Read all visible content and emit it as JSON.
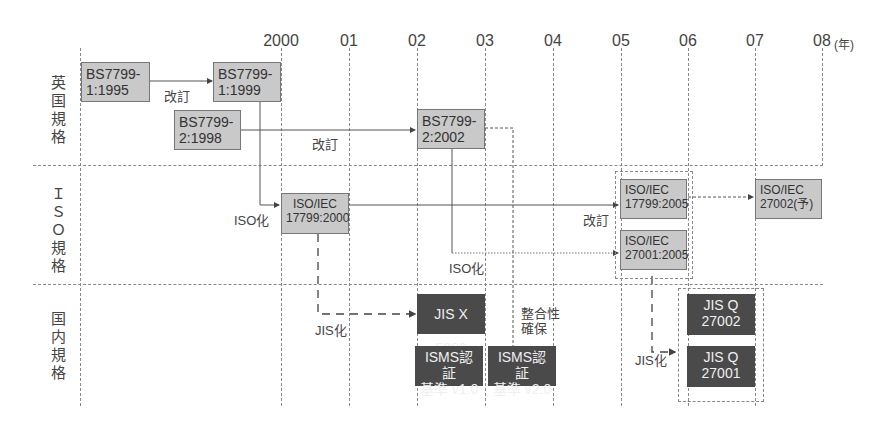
{
  "axis": {
    "years": [
      "2000",
      "01",
      "02",
      "03",
      "04",
      "05",
      "06",
      "07",
      "08"
    ],
    "unit": "(年)"
  },
  "rows": [
    {
      "label": "英国規格"
    },
    {
      "label": "ＩＳＯ規格"
    },
    {
      "label": "国内規格"
    }
  ],
  "boxes": {
    "bs7799_1_1995": {
      "line1": "BS7799-",
      "line2": "1:1995"
    },
    "bs7799_1_1999": {
      "line1": "BS7799-",
      "line2": "1:1999"
    },
    "bs7799_2_1998": {
      "line1": "BS7799-",
      "line2": "2:1998"
    },
    "bs7799_2_2002": {
      "line1": "BS7799-",
      "line2": "2:2002"
    },
    "iso17799_2000": {
      "line1": "ISO/IEC",
      "line2": "17799:2000"
    },
    "iso17799_2005": {
      "line1": "ISO/IEC",
      "line2": "17799:2005"
    },
    "iso27001_2005": {
      "line1": "ISO/IEC",
      "line2": "27001:2005"
    },
    "iso27002": {
      "line1": "ISO/IEC",
      "line2": "27002(予)"
    },
    "jisx5080": {
      "line1": "JIS X 5080"
    },
    "isms_v1": {
      "line1": "ISMS認証",
      "line2": "基準 v1.0"
    },
    "isms_v2": {
      "line1": "ISMS認証",
      "line2": "基準 v2.0"
    },
    "jisq27002": {
      "line1": "JIS Q",
      "line2": "27002"
    },
    "jisq27001": {
      "line1": "JIS Q",
      "line2": "27001"
    }
  },
  "labels": {
    "revise1": "改訂",
    "revise2": "改訂",
    "revise3": "改訂",
    "iso_ize1": "ISO化",
    "iso_ize2": "ISO化",
    "jis_ize1": "JIS化",
    "jis_ize2": "JIS化",
    "consistency1": "整合性",
    "consistency2": "確保"
  },
  "colors": {
    "box_gray": "#c9c9c9",
    "box_dark": "#4a4a4a",
    "grid": "#888888"
  }
}
